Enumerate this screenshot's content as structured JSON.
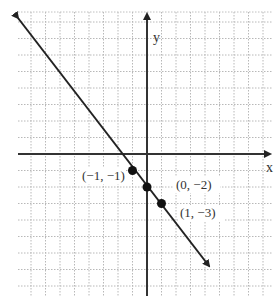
{
  "graph": {
    "title": "Graph of a linear equation through three points",
    "axes": {
      "x_label": "x",
      "y_label": "y"
    },
    "origin_px": [
      147,
      154
    ],
    "unit_px": [
      14.5,
      16.5
    ],
    "grid": {
      "left": 18,
      "top": 12,
      "right": 272,
      "bottom": 296
    },
    "line": {
      "from": [
        -8.8,
        8.3
      ],
      "to": [
        4.2,
        -6.8
      ],
      "color": "#222222"
    },
    "points": [
      {
        "x": -1,
        "y": -1,
        "label": "(−1, −1)"
      },
      {
        "x": 0,
        "y": -2,
        "label": "(0, −2)"
      },
      {
        "x": 1,
        "y": -3,
        "label": "(1, −3)"
      }
    ],
    "top_cut_text": "),(   ),(   )"
  }
}
